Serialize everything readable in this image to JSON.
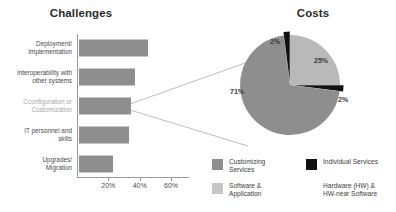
{
  "chart_data": [
    {
      "type": "bar",
      "title": "Challenges",
      "orientation": "horizontal",
      "xlabel": "",
      "ylabel": "",
      "xlim": [
        0,
        70
      ],
      "xticks": [
        20,
        40,
        60
      ],
      "xtick_labels": [
        "20%",
        "40%",
        "60%"
      ],
      "grid": false,
      "legend": "none",
      "bar_color": "#8e8e8e",
      "categories": [
        "Deployment/ Implementation",
        "Interoperability with other systems",
        "Cconfiguration or Customization",
        "IT personnel and skills",
        "Upgrades/ Migration"
      ],
      "category_lines": [
        [
          "Deployment/",
          "Implementation"
        ],
        [
          "Interoperability with",
          "other systems"
        ],
        [
          "Cconfiguration or",
          "Customization"
        ],
        [
          "IT personnel and",
          "skills"
        ],
        [
          "Upgrades/",
          "Migration"
        ]
      ],
      "values": [
        44,
        36,
        33,
        32,
        22
      ],
      "highlighted_category": "Cconfiguration or Customization"
    },
    {
      "type": "pie",
      "title": "Costs",
      "labels": [
        "Software & Application",
        "Hardware (HW) & HW-near Software",
        "Customizing Services",
        "Individual Services"
      ],
      "values": [
        25,
        2,
        71,
        2
      ],
      "value_labels": [
        "25%",
        "2%",
        "71%",
        "2%"
      ],
      "colors": [
        "#b9b9b9",
        "#111111",
        "#8e8e8e",
        "#111111"
      ],
      "legend": "bottom"
    }
  ],
  "challenges": {
    "title": "Challenges",
    "axis": {
      "ticks": [
        {
          "label": "20%",
          "value": 20
        },
        {
          "label": "40%",
          "value": 40
        },
        {
          "label": "60%",
          "value": 60
        }
      ]
    },
    "bars": [
      {
        "line1": "Deployment/",
        "line2": "Implementation",
        "value": 44,
        "muted": false
      },
      {
        "line1": "Interoperability with",
        "line2": "other systems",
        "value": 36,
        "muted": false
      },
      {
        "line1": "Cconfiguration or",
        "line2": "Customization",
        "value": 33,
        "muted": true
      },
      {
        "line1": "IT personnel and",
        "line2": "skills",
        "value": 32,
        "muted": false
      },
      {
        "line1": "Upgrades/",
        "line2": "Migration",
        "value": 22,
        "muted": false
      }
    ]
  },
  "costs": {
    "title": "Costs",
    "slices": [
      {
        "label": "25%",
        "value": 25
      },
      {
        "label": "2%",
        "value": 2
      },
      {
        "label": "71%",
        "value": 71
      },
      {
        "label": "2%",
        "value": 2
      }
    ],
    "legend": [
      {
        "line1": "Customizing",
        "line2": "Services",
        "color": "#8e8e8e",
        "swatch": true
      },
      {
        "line1": "Software &",
        "line2": "Application",
        "color": "#c6c6c6",
        "swatch": true
      },
      {
        "line1": "Individual Services",
        "line2": "",
        "color": "#111111",
        "swatch": true
      },
      {
        "line1": "Hardware (HW) &",
        "line2": "HW-near Software",
        "color": "#ffffff",
        "swatch": false
      }
    ]
  },
  "colors": {
    "bar": "#8e8e8e",
    "pie_customizing": "#8e8e8e",
    "pie_software": "#b9b9b9",
    "pie_individual": "#111111",
    "pie_hardware": "#111111",
    "axis": "#9a9a9a",
    "text": "#3a3a3a",
    "muted_text": "#a8a8a8"
  }
}
